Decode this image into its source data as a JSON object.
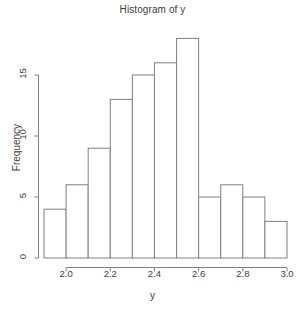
{
  "chart_data": {
    "type": "bar",
    "title": "Histogram of y",
    "xlabel": "y",
    "ylabel": "Frequency",
    "categories": [
      "1.9-2.0",
      "2.0-2.1",
      "2.1-2.2",
      "2.2-2.3",
      "2.3-2.4",
      "2.4-2.5",
      "2.5-2.6",
      "2.6-2.7",
      "2.7-2.8",
      "2.8-2.9",
      "2.9-3.0"
    ],
    "bin_edges": [
      1.9,
      2.0,
      2.1,
      2.2,
      2.3,
      2.4,
      2.5,
      2.6,
      2.7,
      2.8,
      2.9,
      3.0
    ],
    "values": [
      4,
      6,
      9,
      13,
      15,
      16,
      18,
      5,
      6,
      5,
      3
    ],
    "xlim": [
      1.9,
      3.0
    ],
    "ylim": [
      0,
      18
    ],
    "xticks": [
      2.0,
      2.2,
      2.4,
      2.6,
      2.8,
      3.0
    ],
    "xtick_labels": [
      "2.0",
      "2.2",
      "2.4",
      "2.6",
      "2.8",
      "3.0"
    ],
    "yticks": [
      0,
      5,
      10,
      15
    ],
    "ytick_labels": [
      "0",
      "5",
      "10",
      "15"
    ],
    "grid": false,
    "legend": false,
    "bar_fill": "#ffffff",
    "bar_stroke": "#808080",
    "axis_color": "#808080",
    "text_color": "#404040"
  }
}
